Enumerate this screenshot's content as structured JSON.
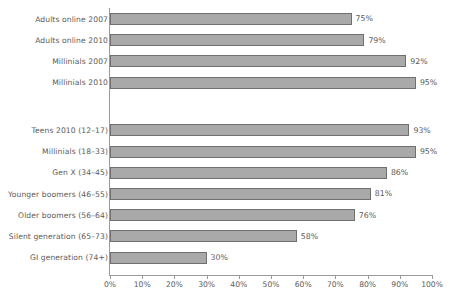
{
  "chart_data": {
    "type": "bar",
    "orientation": "horizontal",
    "title": "",
    "xlabel": "",
    "ylabel": "",
    "xlim": [
      0,
      100
    ],
    "xticks": [
      "0%",
      "10%",
      "20%",
      "30%",
      "40%",
      "50%",
      "60%",
      "70%",
      "80%",
      "90%",
      "100%"
    ],
    "xtick_values": [
      0,
      10,
      20,
      30,
      40,
      50,
      60,
      70,
      80,
      90,
      100
    ],
    "grid": false,
    "legend": false,
    "bar_color": "#a9a9a9",
    "bar_border_color": "#6f6f6f",
    "axis_color": "#9a9a9a",
    "text_color": "#5a5a5a",
    "background": "#ffffff",
    "groups": [
      {
        "name": "group-1",
        "categories": [
          "Adults online 2007",
          "Adults online 2010",
          "Millinials 2007",
          "Millinials 2010"
        ],
        "values": [
          75,
          79,
          92,
          95
        ],
        "labels": [
          "75%",
          "79%",
          "92%",
          "95%"
        ]
      },
      {
        "name": "group-2",
        "categories": [
          "Teens 2010 (12–17)",
          "Millinials (18–33)",
          "Gen X (34–45)",
          "Younger boomers (46–55)",
          "Older boomers (56–64)",
          "Silent generation (65–73)",
          "GI generation (74+)"
        ],
        "values": [
          93,
          95,
          86,
          81,
          76,
          58,
          30
        ],
        "labels": [
          "93%",
          "95%",
          "86%",
          "81%",
          "76%",
          "58%",
          "30%"
        ]
      }
    ]
  }
}
